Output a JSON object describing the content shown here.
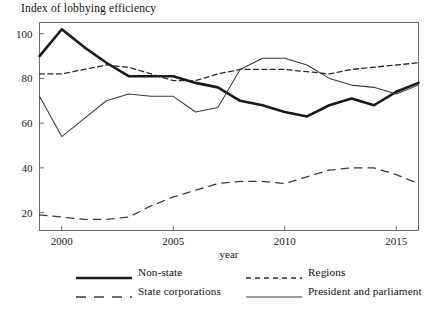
{
  "chart_data": {
    "type": "line",
    "title": "Index of lobbying efficiency",
    "xlabel": "year",
    "ylabel": "",
    "xlim": [
      1999,
      2016
    ],
    "ylim": [
      12,
      105
    ],
    "grid": false,
    "legend_position": "bottom",
    "x": [
      1999,
      2000,
      2001,
      2002,
      2003,
      2004,
      2005,
      2006,
      2007,
      2008,
      2009,
      2010,
      2011,
      2012,
      2013,
      2014,
      2015,
      2016
    ],
    "xticks": [
      2000,
      2005,
      2010,
      2015
    ],
    "xticklabels": [
      "2000",
      "2005",
      "2010",
      "2015"
    ],
    "yticks": [
      20,
      40,
      60,
      80,
      100
    ],
    "yticklabels": [
      "20",
      "40",
      "60",
      "80",
      "100"
    ],
    "series": [
      {
        "name": "Non-state",
        "style": "solid-thick",
        "color": "#1a1a1a",
        "values": [
          90,
          102,
          94,
          87,
          81,
          81,
          81,
          78,
          76,
          70,
          68,
          65,
          63,
          68,
          71,
          68,
          74,
          78
        ]
      },
      {
        "name": "State corporations",
        "style": "dashed-long",
        "color": "#3a3a3a",
        "values": [
          19,
          18,
          17,
          17,
          18,
          23,
          27,
          30,
          33,
          34,
          34,
          33,
          36,
          39,
          40,
          40,
          37,
          33
        ]
      },
      {
        "name": "Regions",
        "style": "dashed-short",
        "color": "#2a2a2a",
        "values": [
          82,
          82,
          84,
          86,
          85,
          82,
          79,
          79,
          82,
          84,
          84,
          84,
          83,
          82,
          84,
          85,
          86,
          87
        ]
      },
      {
        "name": "President and parliament",
        "style": "solid-thin",
        "color": "#3a3a3a",
        "values": [
          72,
          54,
          62,
          70,
          73,
          72,
          72,
          65,
          67,
          84,
          89,
          89,
          86,
          80,
          77,
          76,
          73,
          77
        ]
      }
    ]
  },
  "legend": {
    "items": [
      {
        "label": "Non-state",
        "style": "solid-thick"
      },
      {
        "label": "Regions",
        "style": "dashed-short"
      },
      {
        "label": "State corporations",
        "style": "dashed-long"
      },
      {
        "label": "President and parliament",
        "style": "solid-thin"
      }
    ]
  },
  "axis": {
    "x_title": "year"
  }
}
